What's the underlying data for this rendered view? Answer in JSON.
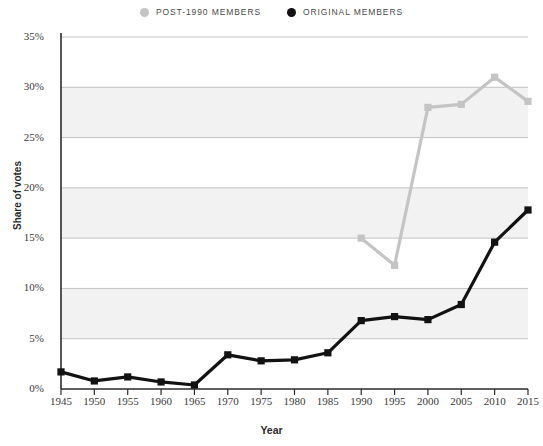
{
  "chart_data": {
    "type": "line",
    "title": "",
    "xlabel": "Year",
    "ylabel": "Share of votes",
    "xlim": [
      1945,
      2015
    ],
    "ylim": [
      0,
      35
    ],
    "x_ticks": [
      "1945",
      "1950",
      "1955",
      "1960",
      "1965",
      "1970",
      "1975",
      "1980",
      "1985",
      "1990",
      "1995",
      "2000",
      "2005",
      "2010",
      "2015"
    ],
    "y_ticks": [
      "0%",
      "5%",
      "10%",
      "15%",
      "20%",
      "25%",
      "30%",
      "35%"
    ],
    "y_tick_values": [
      0,
      5,
      10,
      15,
      20,
      25,
      30,
      35
    ],
    "grid": true,
    "legend_position": "top-center",
    "x": [
      1945,
      1950,
      1955,
      1960,
      1965,
      1970,
      1975,
      1980,
      1985,
      1990,
      1995,
      2000,
      2005,
      2010,
      2015
    ],
    "series": [
      {
        "name": "POST-1990 MEMBERS",
        "color": "#c4c4c4",
        "marker": "square",
        "x": [
          1990,
          1995,
          2000,
          2005,
          2010,
          2015
        ],
        "values": [
          15.0,
          12.3,
          28.0,
          28.3,
          31.0,
          28.6
        ]
      },
      {
        "name": "ORIGINAL MEMBERS",
        "color": "#121212",
        "marker": "square",
        "x": [
          1945,
          1950,
          1955,
          1960,
          1965,
          1970,
          1975,
          1980,
          1985,
          1990,
          1995,
          2000,
          2005,
          2010,
          2015
        ],
        "values": [
          1.7,
          0.8,
          1.2,
          0.7,
          0.4,
          3.4,
          2.8,
          2.9,
          3.6,
          6.8,
          7.2,
          6.9,
          8.4,
          14.6,
          17.8
        ]
      }
    ]
  },
  "legend": {
    "items": [
      {
        "label": "POST-1990 MEMBERS",
        "color": "#c4c4c4"
      },
      {
        "label": "ORIGINAL MEMBERS",
        "color": "#121212"
      }
    ]
  },
  "axes": {
    "y_title": "Share of votes",
    "x_title": "Year"
  }
}
